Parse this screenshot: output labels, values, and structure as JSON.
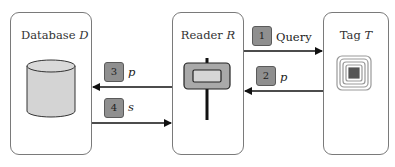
{
  "diagram": {
    "entities": [
      {
        "id": "database",
        "title": "Database",
        "var": "D",
        "icon": "database-cylinder-icon"
      },
      {
        "id": "reader",
        "title": "Reader",
        "var": "R",
        "icon": "rfid-reader-icon"
      },
      {
        "id": "tag",
        "title": "Tag",
        "var": "T",
        "icon": "rfid-tag-icon"
      }
    ],
    "messages": [
      {
        "step": "1",
        "label": "Query",
        "from": "reader",
        "to": "tag"
      },
      {
        "step": "2",
        "label": "p",
        "from": "tag",
        "to": "reader"
      },
      {
        "step": "3",
        "label": "p",
        "from": "reader",
        "to": "database"
      },
      {
        "step": "4",
        "label": "s",
        "from": "database",
        "to": "reader"
      }
    ]
  },
  "colors": {
    "badge_fill": "#8f8f8f",
    "cylinder_fill": "#d4d4d4",
    "reader_outer": "#a9a9a9",
    "reader_inner": "#d6d6d6",
    "tag_chip": "#555555",
    "arrow": "#111111"
  }
}
